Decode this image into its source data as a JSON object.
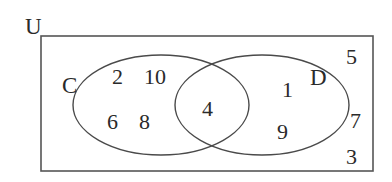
{
  "diagram": {
    "type": "venn",
    "universal_set": {
      "label": "U",
      "elements_outside_sets": [
        "5",
        "7",
        "3"
      ]
    },
    "sets": [
      {
        "label": "C",
        "elements_only": [
          "2",
          "10",
          "6",
          "8"
        ]
      },
      {
        "label": "D",
        "elements_only": [
          "1",
          "9"
        ]
      }
    ],
    "intersection": {
      "sets": [
        "C",
        "D"
      ],
      "elements": [
        "4"
      ]
    }
  },
  "labels": {
    "universe": "U",
    "set_c": "C",
    "set_d": "D"
  },
  "numbers": {
    "c_only_1": "2",
    "c_only_2": "10",
    "c_only_3": "6",
    "c_only_4": "8",
    "c_and_d": "4",
    "d_only_1": "1",
    "d_only_2": "9",
    "outside_1": "5",
    "outside_2": "7",
    "outside_3": "3"
  },
  "colors": {
    "stroke": "#4a4a4a",
    "text": "#2a2a2a",
    "background": "#ffffff"
  }
}
